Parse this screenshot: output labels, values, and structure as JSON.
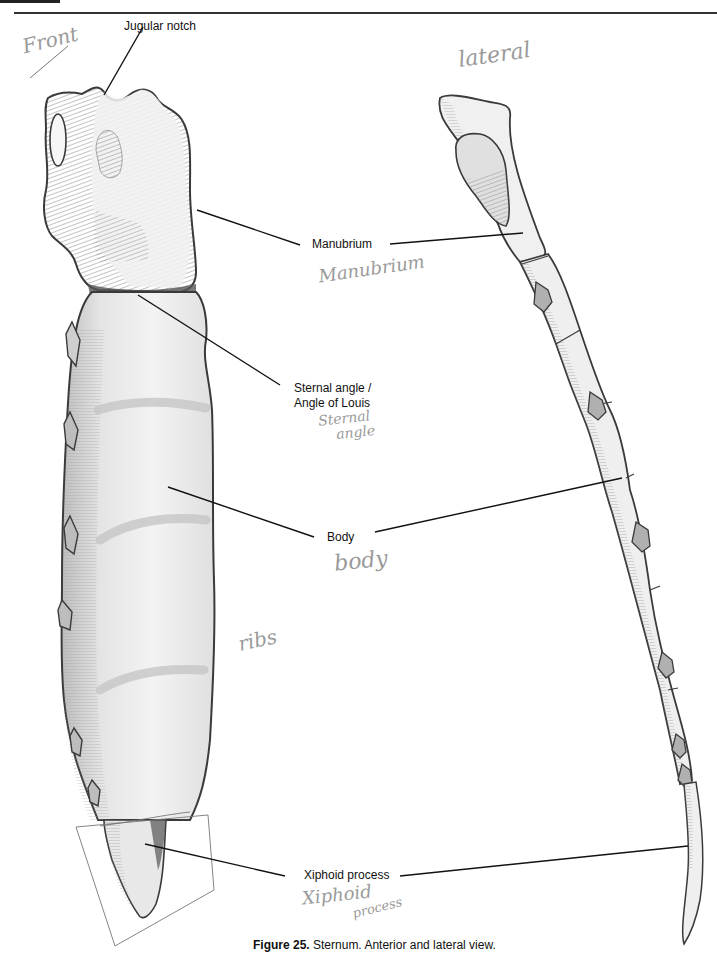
{
  "figure": {
    "number_label": "Figure 25.",
    "caption_text": " Sternum. Anterior and lateral view."
  },
  "views": {
    "anterior": {
      "handwritten_label": "Front"
    },
    "lateral": {
      "handwritten_label": "lateral"
    }
  },
  "labels": [
    {
      "id": "jugular-notch",
      "text": "Jugular notch"
    },
    {
      "id": "manubrium",
      "text": "Manubrium",
      "handwritten": "Manubrium"
    },
    {
      "id": "sternal-angle",
      "text_line1": "Sternal angle /",
      "text_line2": "Angle of Louis",
      "handwritten_line1": "Sternal",
      "handwritten_line2": "angle"
    },
    {
      "id": "body",
      "text": "Body",
      "handwritten": "body"
    },
    {
      "id": "xiphoid-process",
      "text": "Xiphoid process",
      "handwritten_line1": "Xiphoid",
      "handwritten_line2": "process"
    }
  ],
  "annotations": {
    "ribs_note": "ribs"
  },
  "colors": {
    "outline": "#3a3a3a",
    "bone_fill": "#ececec",
    "shade": "#b5b5b5",
    "dark_shade": "#8a8a8a",
    "leader": "#111111",
    "pencil": "#9a9a9a"
  }
}
